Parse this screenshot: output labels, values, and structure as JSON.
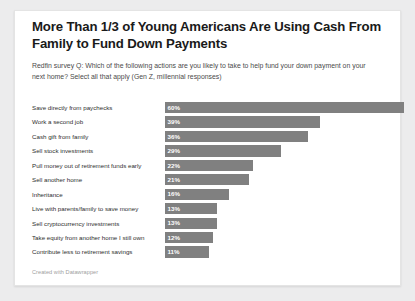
{
  "chart_data": {
    "type": "bar",
    "orientation": "horizontal",
    "title": "More Than 1/3 of Young Americans Are Using Cash From Family to Fund Down Payments",
    "subtitle": "Redfin survey Q: Which of the following actions are you likely to take to help fund your down payment on your next home? Select all that apply (Gen Z, millennial responses)",
    "footer": "Created with Datawrapper",
    "categories": [
      "Save directly from paychecks",
      "Work a second job",
      "Cash gift from family",
      "Sell stock investments",
      "Pull money out of retirement funds early",
      "Sell another home",
      "Inheritance",
      "Live with parents/family to save money",
      "Sell cryptocurrency investments",
      "Take equity from another home I still own",
      "Contribute less to retirement savings"
    ],
    "values": [
      60,
      39,
      36,
      29,
      22,
      21,
      16,
      13,
      13,
      12,
      11
    ],
    "value_labels": [
      "60%",
      "39%",
      "36%",
      "29%",
      "22%",
      "21%",
      "16%",
      "13%",
      "13%",
      "12%",
      "11%"
    ],
    "xlabel": "",
    "ylabel": "",
    "xlim": [
      0,
      60
    ],
    "grid": false,
    "legend": false,
    "bar_color": "#808080",
    "background_color": "#ffffff",
    "page_background": "#ececed"
  }
}
